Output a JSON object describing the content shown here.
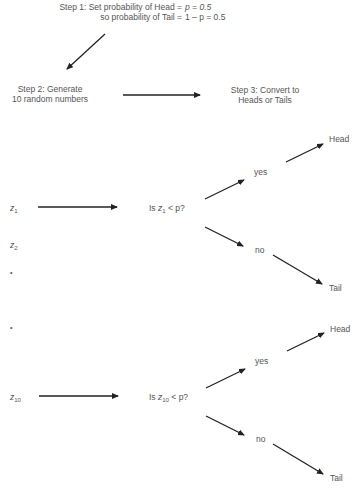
{
  "step1": {
    "line1_label": "Step 1: Set probability of Head =",
    "line1_value": "p = 0.5",
    "line2_label": "so probability of Tail =",
    "line2_value": "1 – p = 0.5"
  },
  "step2": {
    "line1": "Step 2: Generate",
    "line2": "10 random numbers"
  },
  "step3": {
    "line1": "Step 3: Convert to",
    "line2": "Heads or Tails"
  },
  "randoms": {
    "z1": {
      "var": "z",
      "sub": "1"
    },
    "z2": {
      "var": "z",
      "sub": "2"
    },
    "dot": "•",
    "z10": {
      "var": "z",
      "sub": "10"
    }
  },
  "decision1": {
    "prefix": "Is",
    "var": "z",
    "sub": "1",
    "suffix": "< p?"
  },
  "decision10": {
    "prefix": "Is",
    "var": "z",
    "sub": "10",
    "suffix": "< p?"
  },
  "branches": {
    "yes": "yes",
    "no": "no",
    "head": "Head",
    "tail": "Tail"
  },
  "colors": {
    "text": "#555555",
    "arrow": "#222222",
    "background": "#ffffff"
  }
}
